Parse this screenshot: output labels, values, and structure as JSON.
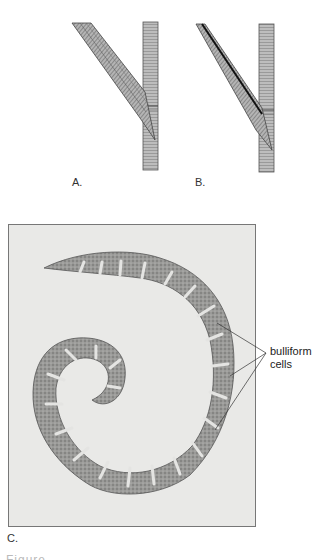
{
  "figure": {
    "panels": [
      {
        "id": "A",
        "label": "A.",
        "content": "Drawing of grass leaf sheath and blade attached to stem (blade spreading away)"
      },
      {
        "id": "B",
        "label": "B.",
        "content": "Drawing of grass leaf sheath and blade attached to stem (blade with dark midrib line)"
      },
      {
        "id": "C",
        "label": "C.",
        "content": "Light micrograph of rolled grass leaf cross-section"
      }
    ],
    "annotation": {
      "line1": "bulliform",
      "line2": "cells",
      "pointer_count": 3
    },
    "caption_partial": "Figure ..."
  },
  "colors": {
    "background": "#ffffff",
    "micrograph_bg": "#e9e9e7",
    "tissue": "#7a7a7a",
    "frame_border": "#777777"
  }
}
